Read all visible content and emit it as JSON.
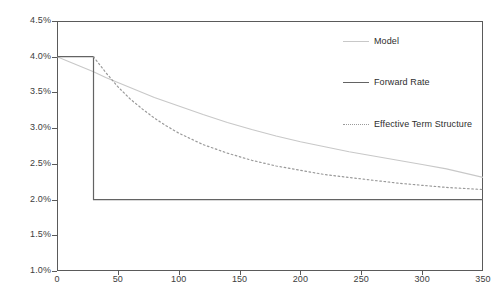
{
  "chart_data": {
    "type": "line",
    "title": "",
    "xlabel": "",
    "ylabel": "",
    "xlim": [
      0,
      350
    ],
    "ylim": [
      0.01,
      0.045
    ],
    "grid": false,
    "legend_position": "inside-upper-right",
    "y_tick_labels": [
      "4.5%",
      "4.0%",
      "3.5%",
      "3.0%",
      "2.5%",
      "2.0%",
      "1.5%",
      "1.0%"
    ],
    "y_tick_values": [
      0.045,
      0.04,
      0.035,
      0.03,
      0.025,
      0.02,
      0.015,
      0.01
    ],
    "x_tick_labels": [
      "0",
      "50",
      "100",
      "150",
      "200",
      "250",
      "300",
      "350"
    ],
    "x_tick_values": [
      0,
      50,
      100,
      150,
      200,
      250,
      300,
      350
    ],
    "series": [
      {
        "name": "Model",
        "style": "solid",
        "color": "#c8c8c8",
        "x": [
          0,
          10,
          20,
          30,
          40,
          50,
          60,
          70,
          80,
          90,
          100,
          120,
          140,
          160,
          180,
          200,
          220,
          240,
          260,
          280,
          300,
          320,
          350
        ],
        "values": [
          0.04,
          0.0393,
          0.0386,
          0.0379,
          0.0371,
          0.0364,
          0.0357,
          0.035,
          0.0343,
          0.0337,
          0.0331,
          0.0319,
          0.0308,
          0.0298,
          0.0289,
          0.0281,
          0.0274,
          0.0267,
          0.0261,
          0.0255,
          0.0249,
          0.0243,
          0.0231
        ]
      },
      {
        "name": "Forward Rate",
        "style": "solid",
        "color": "#636363",
        "x": [
          0,
          30,
          30,
          350
        ],
        "values": [
          0.04,
          0.04,
          0.02,
          0.02
        ]
      },
      {
        "name": "Effective Term Structure",
        "style": "dotted",
        "color": "#9a9a9a",
        "x": [
          30,
          40,
          50,
          60,
          70,
          80,
          90,
          100,
          120,
          140,
          160,
          180,
          200,
          220,
          240,
          260,
          280,
          300,
          320,
          350
        ],
        "values": [
          0.04,
          0.0378,
          0.0358,
          0.0341,
          0.0327,
          0.0314,
          0.0303,
          0.0293,
          0.0277,
          0.0265,
          0.0255,
          0.0247,
          0.0241,
          0.0235,
          0.0231,
          0.0227,
          0.0223,
          0.022,
          0.0217,
          0.0214
        ]
      }
    ]
  },
  "legend": {
    "entries": [
      {
        "label": "Model"
      },
      {
        "label": "Forward Rate"
      },
      {
        "label": "Effective Term Structure"
      }
    ]
  }
}
